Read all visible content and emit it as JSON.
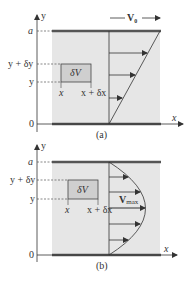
{
  "colors": {
    "channel_fill": "#e6e6e6",
    "plate": "#555555",
    "line": "#333333",
    "element_fill": "#cfcfcf",
    "dash": "#555555"
  },
  "panel_a": {
    "caption": "(a)",
    "axis_y_label": "y",
    "axis_x_label": "x",
    "label_a": "a",
    "label_y_plus_dy": "y + δy",
    "label_y": "y",
    "label_zero": "0",
    "label_x": "x",
    "label_x_plus_dx": "x + δx",
    "element_label": "δV",
    "velocity_label": "V",
    "velocity_subscript": "0",
    "profile_type": "linear (Couette)"
  },
  "panel_b": {
    "caption": "(b)",
    "axis_y_label": "y",
    "axis_x_label": "x",
    "label_a": "a",
    "label_y_plus_dy": "y + δy",
    "label_y": "y",
    "label_zero": "0",
    "label_x": "x",
    "label_x_plus_dx": "x + δx",
    "element_label": "δV",
    "velocity_label": "V",
    "velocity_subscript": "max",
    "profile_type": "parabolic (Poiseuille)"
  }
}
